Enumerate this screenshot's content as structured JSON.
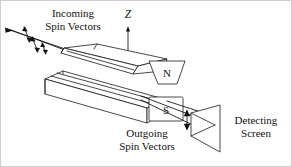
{
  "figure": {
    "background_color": "#ffffff",
    "ink_color": "#111111",
    "labels": {
      "incoming_line1": "Incoming",
      "incoming_line2": "Spin Vectors",
      "outgoing_line1": "Outgoing",
      "outgoing_line2": "Spin Vectors",
      "screen_line1": "Detecting",
      "screen_line2": "Screen",
      "axis_z": "Z",
      "pole_north": "N",
      "pole_south": "S"
    },
    "elements": {
      "incoming_beam": "incoming particle beam with randomly oriented spin vectors",
      "magnet_top": "wedge-shaped north pole magnet",
      "magnet_bottom": "flat south pole magnet with grooved face",
      "field_lines": "inhomogeneous magnetic field lines between poles",
      "outgoing_beams": "two deflected beams (spin up and spin down)",
      "detecting_screen": "tilted rectangular detecting screen in perspective",
      "z_axis": "vertical Z axis arrow pointing up"
    },
    "spin_arrow_count_incoming": 3,
    "spin_arrow_count_outgoing": 1
  }
}
